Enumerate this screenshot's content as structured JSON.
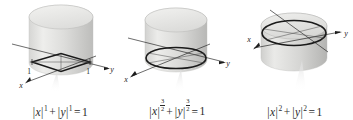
{
  "figure": {
    "background_color": "#ffffff",
    "panel_count": 3
  },
  "colors": {
    "surface_light": "#e3e3e1",
    "surface_mid": "#cfcfcd",
    "surface_dark": "#b4b4b2",
    "surface_top": "#ededeb",
    "curve": "#1a1a1a",
    "axis": "#1c1c1c",
    "text": "#2b2b2b",
    "leader": "#f2f2f2"
  },
  "panels": [
    {
      "id": "panel-1",
      "exponent_label": "1",
      "exponent_kind": "integer",
      "cross_section": "diamond",
      "caption": {
        "full_text": "|x|^1 + |y|^1 = 1",
        "x_var": "x",
        "y_var": "y",
        "x_exponent": "1",
        "y_exponent": "1",
        "plus": "+",
        "equals": "=",
        "rhs": "1",
        "bar": "|"
      },
      "axes": [
        {
          "name": "x-axis",
          "label": "x"
        },
        {
          "name": "y-axis",
          "label": "y"
        },
        {
          "name": "z-axis",
          "label": ""
        }
      ],
      "ticks": [
        {
          "name": "x-tick-1",
          "label": "1"
        },
        {
          "name": "y-tick-1",
          "label": "1"
        }
      ]
    },
    {
      "id": "panel-2",
      "exponent_label": "3/2",
      "exponent_kind": "fraction",
      "exponent_numerator": "3",
      "exponent_denominator": "2",
      "cross_section": "rounded-superellipse",
      "caption": {
        "full_text": "|x|^(3/2) + |y|^(3/2) = 1",
        "x_var": "x",
        "y_var": "y",
        "x_exponent": "3/2",
        "y_exponent": "3/2",
        "plus": "+",
        "equals": "=",
        "rhs": "1",
        "bar": "|"
      },
      "axes": [
        {
          "name": "x-axis",
          "label": "x"
        },
        {
          "name": "y-axis",
          "label": "y"
        }
      ],
      "ticks": []
    },
    {
      "id": "panel-3",
      "exponent_label": "2",
      "exponent_kind": "integer",
      "cross_section": "circle",
      "caption": {
        "full_text": "|x|^2 + |y|^2 = 1",
        "x_var": "x",
        "y_var": "y",
        "x_exponent": "2",
        "y_exponent": "2",
        "plus": "+",
        "equals": "=",
        "rhs": "1",
        "bar": "|"
      },
      "axes": [
        {
          "name": "x-axis",
          "label": "x"
        },
        {
          "name": "y-axis",
          "label": "y"
        }
      ],
      "ticks": []
    }
  ]
}
